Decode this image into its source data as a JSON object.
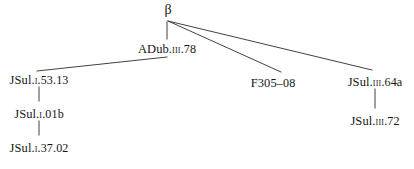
{
  "diagram": {
    "type": "stemma-codicum",
    "title": "",
    "background_color": "#ffffff",
    "line_color": "#2b2b2b",
    "text_color": "#161616",
    "width": 414,
    "height": 169,
    "nodes": [
      {
        "id": "beta",
        "label": "β",
        "prefix": "",
        "roman": "",
        "suffix": "",
        "x": 168,
        "y": 3,
        "level": 0
      },
      {
        "id": "adub",
        "label": "ADub.III.78",
        "prefix": "ADub.",
        "roman": "III",
        "suffix": ".78",
        "x": 167,
        "y": 43,
        "level": 1
      },
      {
        "id": "jsul-i-53",
        "label": "JSul.I.53.13",
        "prefix": "JSul.",
        "roman": "I",
        "suffix": ".53.13",
        "x": 39,
        "y": 74,
        "level": 2
      },
      {
        "id": "jsul-i-01b",
        "label": "JSul.I.01b",
        "prefix": "JSul.",
        "roman": "I",
        "suffix": ".01b",
        "x": 39,
        "y": 108,
        "level": 3
      },
      {
        "id": "jsul-i-37",
        "label": "JSul.I.37.02",
        "prefix": "JSul.",
        "roman": "I",
        "suffix": ".37.02",
        "x": 39,
        "y": 142,
        "level": 4
      },
      {
        "id": "f305",
        "label": "F305–08",
        "prefix": "F305",
        "roman": "",
        "suffix": "–08",
        "x": 273,
        "y": 77,
        "level": 2
      },
      {
        "id": "jsul-iii-64",
        "label": "JSul.III.64a",
        "prefix": "JSul.",
        "roman": "III",
        "suffix": ".64a",
        "x": 375,
        "y": 76,
        "level": 2
      },
      {
        "id": "jsul-iii-72",
        "label": "JSul.III.72",
        "prefix": "JSul.",
        "roman": "III",
        "suffix": ".72",
        "x": 375,
        "y": 115,
        "level": 3
      }
    ],
    "edges": [
      {
        "id": "e-beta-adub",
        "from": "beta",
        "to": "adub",
        "kind": "vertical",
        "x1": 167,
        "y1": 22,
        "x2": 167,
        "y2": 39
      },
      {
        "id": "e-beta-f305",
        "from": "beta",
        "to": "f305",
        "kind": "diagonal",
        "x1": 168,
        "y1": 21,
        "x2": 281,
        "y2": 72
      },
      {
        "id": "e-beta-jsul3-64",
        "from": "beta",
        "to": "jsul-iii-64",
        "kind": "diagonal",
        "x1": 168,
        "y1": 21,
        "x2": 372,
        "y2": 70
      },
      {
        "id": "e-adub-jsul1-53",
        "from": "adub",
        "to": "jsul-i-53",
        "kind": "diagonal",
        "x1": 167,
        "y1": 57,
        "x2": 37,
        "y2": 71
      },
      {
        "id": "e-jsul1-53-01b",
        "from": "jsul-i-53",
        "to": "jsul-i-01b",
        "kind": "vertical",
        "x1": 39,
        "y1": 87,
        "x2": 39,
        "y2": 101
      },
      {
        "id": "e-jsul1-01b-37",
        "from": "jsul-i-01b",
        "to": "jsul-i-37",
        "kind": "vertical",
        "x1": 39,
        "y1": 121,
        "x2": 39,
        "y2": 135
      },
      {
        "id": "e-jsul3-64-72",
        "from": "jsul-iii-64",
        "to": "jsul-iii-72",
        "kind": "vertical",
        "x1": 375,
        "y1": 89,
        "x2": 375,
        "y2": 108
      }
    ],
    "caption": ""
  }
}
